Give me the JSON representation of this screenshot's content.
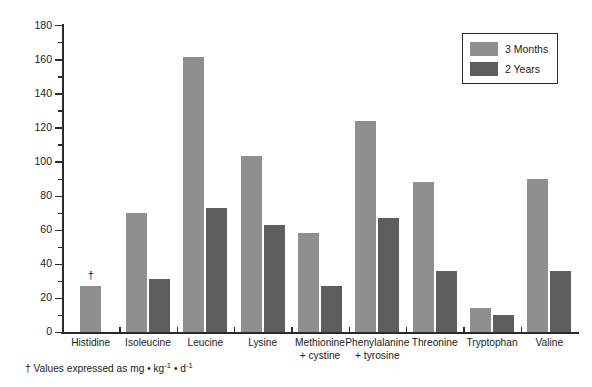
{
  "chart_data": {
    "type": "bar",
    "title": "",
    "subtitle": "",
    "xlabel": "",
    "ylabel": "",
    "ylim": [
      0,
      180
    ],
    "ytick_step": 20,
    "yminor_step": 10,
    "grid": false,
    "legend_position": "top-right",
    "categories": [
      "Histidine",
      "Isoleucine",
      "Leucine",
      "Lysine",
      "Methionine + cystine",
      "Phenylalanine + tyrosine",
      "Threonine",
      "Tryptophan",
      "Valine"
    ],
    "category_lines": [
      [
        "Histidine",
        ""
      ],
      [
        "Isoleucine",
        ""
      ],
      [
        "Leucine",
        ""
      ],
      [
        "Lysine",
        ""
      ],
      [
        "Methionine",
        "+ cystine"
      ],
      [
        "Phenylalanine",
        "+ tyrosine"
      ],
      [
        "Threonine",
        ""
      ],
      [
        "Tryptophan",
        ""
      ],
      [
        "Valine",
        ""
      ]
    ],
    "series": [
      {
        "name": "3 Months",
        "color": "#8f8f8f",
        "values": [
          27,
          70,
          161,
          103,
          58,
          124,
          88,
          14,
          90
        ]
      },
      {
        "name": "2 Years",
        "color": "#5e5e5e",
        "values": [
          null,
          31,
          73,
          63,
          27,
          67,
          36,
          10,
          36
        ]
      }
    ],
    "ytick_labels": [
      "0",
      "20",
      "40",
      "60",
      "80",
      "100",
      "120",
      "140",
      "160",
      "180"
    ],
    "annotations": [
      {
        "text": "†",
        "category": "Histidine",
        "series": "3 Months",
        "note": "dagger marker above Histidine 3 Months bar"
      }
    ]
  },
  "legend": {
    "items": [
      {
        "label": "3 Months",
        "color": "#8f8f8f"
      },
      {
        "label": "2 Years",
        "color": "#5e5e5e"
      }
    ]
  },
  "footnote": {
    "dagger": "†",
    "text_before_sup1": " Values expressed as mg • kg",
    "sup1": "-1",
    "text_between": " • d",
    "sup2": "-1"
  }
}
